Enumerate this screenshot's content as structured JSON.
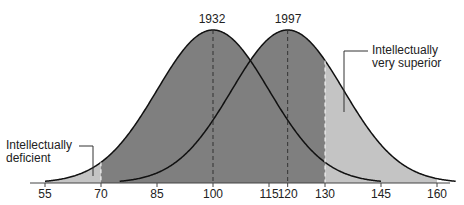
{
  "chart_data": {
    "type": "area",
    "title": "",
    "xlabel": "",
    "ylabel": "",
    "xlim": [
      50,
      165
    ],
    "x_ticks": [
      55,
      70,
      85,
      100,
      115,
      120,
      130,
      145,
      160
    ],
    "series": [
      {
        "name": "1932",
        "mean": 100,
        "sd": 15,
        "color": "#7f7f7f"
      },
      {
        "name": "1997",
        "mean": 120,
        "sd": 15,
        "color": "#7f7f7f"
      }
    ],
    "shaded_regions": [
      {
        "label": "Intellectually deficient",
        "from": 55,
        "to": 70,
        "color": "#c4c4c4"
      },
      {
        "label": "Intellectually very superior",
        "from": 130,
        "to": 160,
        "color": "#c4c4c4"
      }
    ],
    "annotations": [
      {
        "text": "1932",
        "x": 100
      },
      {
        "text": "1997",
        "x": 120
      },
      {
        "text": "Intellectually deficient",
        "x": 67
      },
      {
        "text": "Intellectually very superior",
        "x": 136
      }
    ],
    "grid": false,
    "legend": "none"
  },
  "labels": {
    "year_1932": "1932",
    "year_1997": "1997",
    "deficient_line1": "Intellectually",
    "deficient_line2": "deficient",
    "superior_line1": "Intellectually",
    "superior_line2": "very superior"
  },
  "ticks": [
    "55",
    "70",
    "85",
    "100",
    "115",
    "120",
    "130",
    "145",
    "160"
  ],
  "colors": {
    "dark_fill": "#7f7f7f",
    "light_fill": "#c4c4c4",
    "curve": "#111111"
  }
}
